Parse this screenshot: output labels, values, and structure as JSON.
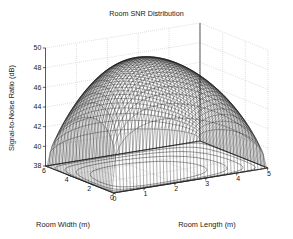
{
  "figure": {
    "title": "Room SNR Distribution",
    "background_color": "#ffffff",
    "foreground_color": "#1a1a1a"
  },
  "axes": {
    "z": {
      "label": "Signal-to-Noise Ratio (dB)",
      "ticks": [
        "50",
        "48",
        "46",
        "44",
        "42",
        "40",
        "38"
      ],
      "min": 38,
      "max": 50,
      "step": 2
    },
    "y": {
      "label": "Room Width (m)",
      "ticks": [
        "6",
        "4",
        "2",
        "0"
      ],
      "min": 0,
      "max": 6,
      "step": 2
    },
    "x": {
      "label": "Room Length (m)",
      "ticks": [
        "0",
        "1",
        "2",
        "3",
        "4",
        "5"
      ],
      "min": 0,
      "max": 5,
      "step": 1
    }
  },
  "chart_data": {
    "type": "surface",
    "title": "Room SNR Distribution",
    "xlabel": "Room Length (m)",
    "ylabel": "Room Width (m)",
    "zlabel": "Signal-to-Noise Ratio (dB)",
    "xlim": [
      0,
      5
    ],
    "ylim": [
      0,
      6
    ],
    "zlim": [
      38,
      50
    ],
    "grid": true,
    "legend": null,
    "mesh_color": "#1a1a1a",
    "contour_color": "#555555",
    "projection": "3d mesh with floor contour projection",
    "x": [
      0,
      0.5,
      1,
      1.5,
      2,
      2.5,
      3,
      3.5,
      4,
      4.5,
      5
    ],
    "y": [
      0,
      0.6,
      1.2,
      1.8,
      2.4,
      3,
      3.6,
      4.2,
      4.8,
      5.4,
      6
    ],
    "z": [
      [
        38.0,
        41.2,
        43.6,
        45.2,
        46.2,
        46.6,
        46.2,
        45.2,
        43.6,
        41.2,
        38.0
      ],
      [
        41.2,
        43.9,
        45.8,
        47.1,
        47.9,
        48.2,
        47.9,
        47.1,
        45.8,
        43.9,
        41.2
      ],
      [
        43.6,
        45.8,
        47.4,
        48.5,
        49.1,
        49.3,
        49.1,
        48.5,
        47.4,
        45.8,
        43.6
      ],
      [
        45.2,
        47.1,
        48.5,
        49.4,
        49.8,
        50.0,
        49.8,
        49.4,
        48.5,
        47.1,
        45.2
      ],
      [
        46.2,
        47.9,
        49.1,
        49.8,
        50.0,
        50.0,
        50.0,
        49.8,
        49.1,
        47.9,
        46.2
      ],
      [
        46.6,
        48.2,
        49.3,
        50.0,
        50.0,
        50.0,
        50.0,
        50.0,
        49.3,
        48.2,
        46.6
      ],
      [
        46.2,
        47.9,
        49.1,
        49.8,
        50.0,
        50.0,
        50.0,
        49.8,
        49.1,
        47.9,
        46.2
      ],
      [
        45.2,
        47.1,
        48.5,
        49.4,
        49.8,
        50.0,
        49.8,
        49.4,
        48.5,
        47.1,
        45.2
      ],
      [
        43.6,
        45.8,
        47.4,
        48.5,
        49.1,
        49.3,
        49.1,
        48.5,
        47.4,
        45.8,
        43.6
      ],
      [
        41.2,
        43.9,
        45.8,
        47.1,
        47.9,
        48.2,
        47.9,
        47.1,
        45.8,
        43.9,
        41.2
      ],
      [
        38.0,
        41.2,
        43.6,
        45.2,
        46.2,
        46.6,
        46.2,
        45.2,
        43.6,
        41.2,
        38.0
      ]
    ],
    "contour_levels": [
      39,
      41,
      43,
      45,
      47
    ],
    "peak_value": 50.0,
    "min_value": 38.0
  }
}
